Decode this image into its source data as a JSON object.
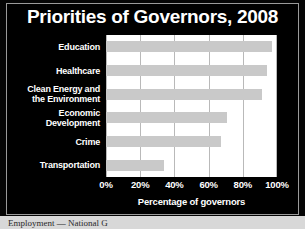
{
  "chart_data": {
    "type": "bar",
    "orientation": "horizontal",
    "title": "Priorities of Governors, 2008",
    "xlabel": "Percentage of governors",
    "ylabel": "",
    "xlim": [
      0,
      100
    ],
    "grid": true,
    "legend": false,
    "categories": [
      "Education",
      "Healthcare",
      "Clean Energy and the Environment",
      "Economic Development",
      "Crime",
      "Transportation"
    ],
    "values": [
      97,
      94,
      91,
      71,
      67,
      34
    ],
    "tick_labels": [
      "0%",
      "20%",
      "40%",
      "60%",
      "80%",
      "100%"
    ],
    "tick_values": [
      0,
      20,
      40,
      60,
      80,
      100
    ],
    "bar_color": "#c9c9c9",
    "plot_background": "#ffffff",
    "panel_background": "#000000",
    "text_color": "#ffffff",
    "grid_color": "#b9b9b9"
  },
  "category_lines": [
    [
      "Education"
    ],
    [
      "Healthcare"
    ],
    [
      "Clean Energy and",
      "the Environment"
    ],
    [
      "Economic",
      "Development"
    ],
    [
      "Crime"
    ],
    [
      "Transportation"
    ]
  ],
  "caption": {
    "partial_text": "Employment — National G"
  }
}
